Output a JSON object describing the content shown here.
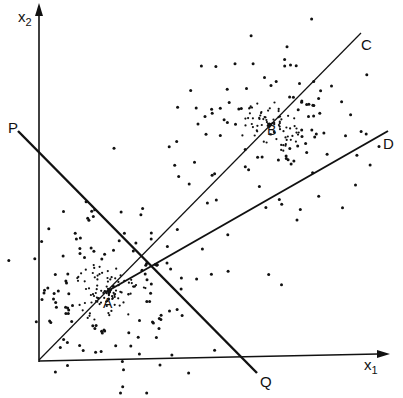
{
  "diagram": {
    "axes": {
      "x_label": "x",
      "x_sub": "1",
      "y_label": "x",
      "y_sub": "2"
    },
    "points": {
      "A": "A",
      "B": "B"
    },
    "lines": {
      "C": "C",
      "D": "D",
      "P": "P",
      "Q": "Q"
    },
    "colors": {
      "ink": "#111111",
      "background": "#ffffff"
    }
  }
}
